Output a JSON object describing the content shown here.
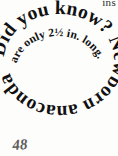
{
  "page": {
    "background_color": "#fdfdfc",
    "text_color": "#111111",
    "folio_number": "48",
    "running_head_fragment": "ins"
  },
  "fact_callout": {
    "headline": "Did you know?",
    "body": "Newborn anacondas are only 2½ in. long.",
    "full_text": "Did you know? Newborn anacondas are only 2½ in. long.",
    "layout": "spiral",
    "outer_ring_text": "Did you know? Newborn anacondas",
    "inner_ring_text": "are only 2½ in. long."
  }
}
